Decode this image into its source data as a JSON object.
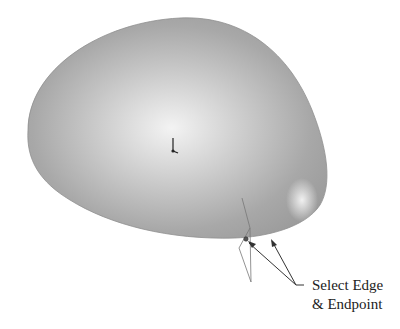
{
  "figure": {
    "colors": {
      "surface_base": "#a9a9a9",
      "surface_highlight": "#f2f2f2",
      "edge_stroke": "#777777",
      "leader": "#333333",
      "background": "#ffffff"
    }
  },
  "callout": {
    "line1": "Select Edge",
    "line2": "& Endpoint"
  },
  "icons": {
    "origin": "origin-triad-icon",
    "endpoint": "endpoint-marker-icon"
  }
}
